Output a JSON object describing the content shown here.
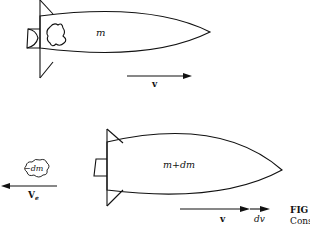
{
  "figure": {
    "caption_label": "FIG",
    "caption_text": "Cons"
  },
  "top_rocket": {
    "mass_label": "m",
    "velocity_label": "v"
  },
  "bottom_rocket": {
    "mass_label": "m+dm",
    "velocity_label": "v",
    "velocity_increment_label": "dv"
  },
  "exhaust": {
    "mass_label": "−dm",
    "velocity_label": "V",
    "velocity_subscript": "e"
  },
  "colors": {
    "stroke": "#111111",
    "background": "#ffffff"
  }
}
